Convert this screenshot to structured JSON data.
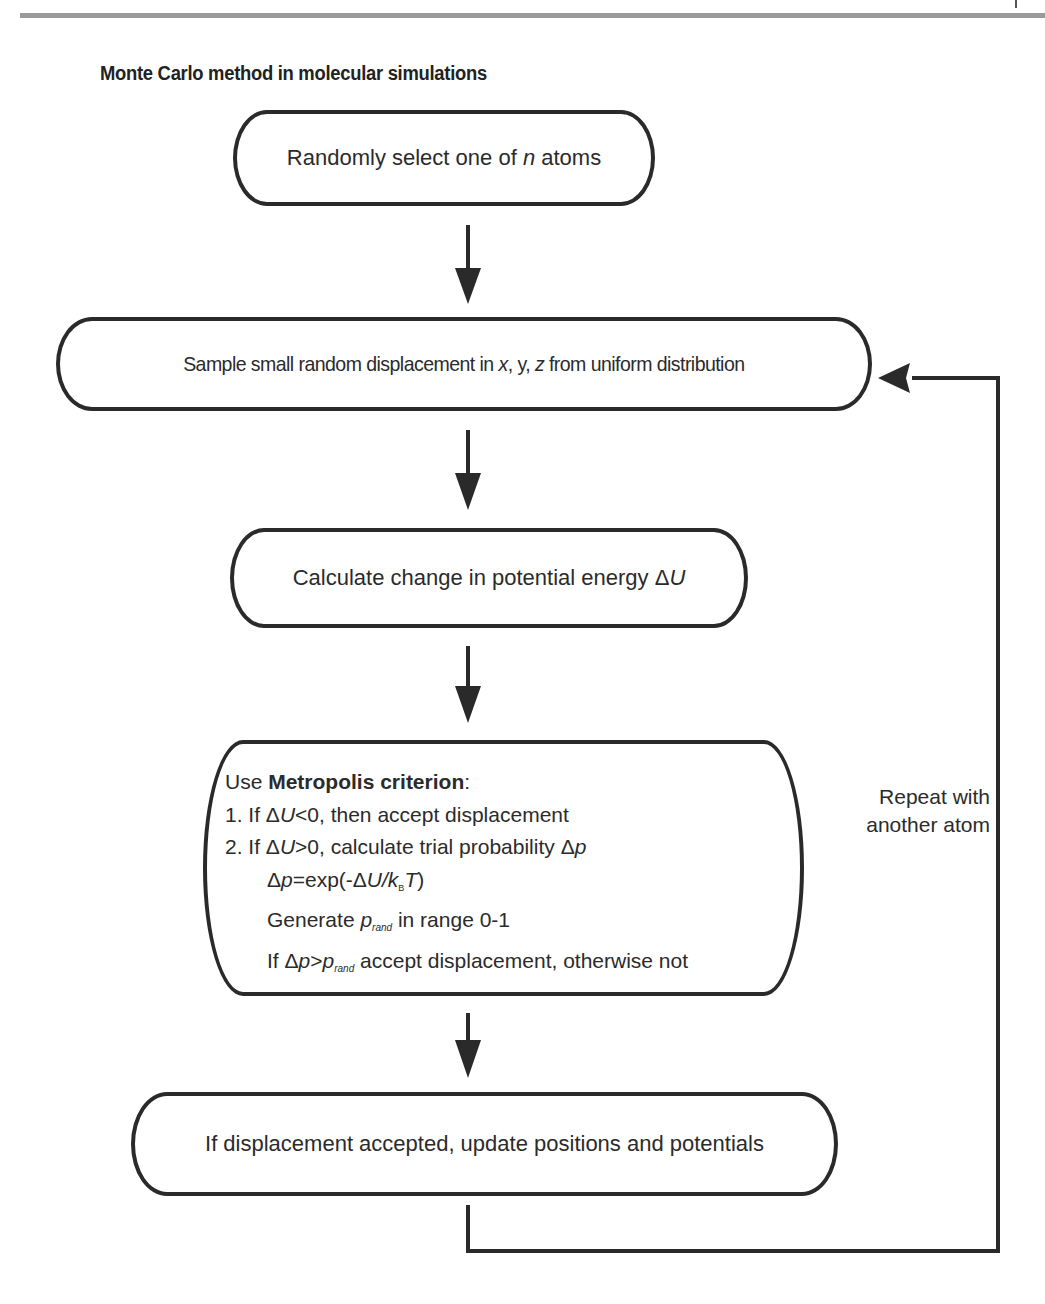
{
  "page": {
    "title": "Monte Carlo method in molecular simulations"
  },
  "flowchart": {
    "steps": [
      {
        "id": "select",
        "text_pre": "Randomly select one of ",
        "text_var": "n",
        "text_post": " atoms"
      },
      {
        "id": "sample",
        "text_pre": "Sample small random displacement in ",
        "var_x": "x",
        "sep1": ", y, ",
        "var_z": "z",
        "text_post": " from uniform distribution"
      },
      {
        "id": "energy",
        "text_pre": "Calculate change in potential energy ",
        "delta": "Δ",
        "var": "U"
      },
      {
        "id": "metropolis",
        "heading_pre": "Use ",
        "heading_bold": "Metropolis criterion",
        "heading_post": ":",
        "line1": {
          "prefix": "1. If ",
          "delta": "Δ",
          "var": "U",
          "rest": "<0, then accept displacement"
        },
        "line2": {
          "prefix": "2. If ",
          "delta": "Δ",
          "var": "U",
          "rest": ">0, calculate trial probability ",
          "delta2": "Δ",
          "var2": "p"
        },
        "line3": {
          "delta": "Δ",
          "var": "p",
          "mid": "=exp(-",
          "delta2": "Δ",
          "var2": "U/k",
          "sub": "B",
          "var3": "T",
          "end": ")"
        },
        "line4": {
          "prefix": "Generate ",
          "var": "p",
          "sub": "rand",
          "rest": " in range 0-1"
        },
        "line5": {
          "prefix": "If ",
          "delta": "Δ",
          "var": "p",
          "op": ">",
          "var2": "p",
          "sub": "rand",
          "rest": " accept displacement, otherwise not"
        }
      },
      {
        "id": "update",
        "text": "If displacement accepted, update positions and potentials"
      }
    ],
    "loop_label_line1": "Repeat with",
    "loop_label_line2": "another atom"
  },
  "colors": {
    "stroke": "#2a2a2a",
    "text": "#2b2b2b",
    "top_rule": "#9a9a9a",
    "background": "#ffffff"
  }
}
